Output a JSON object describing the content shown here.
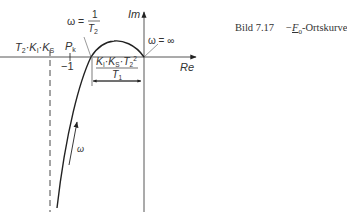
{
  "caption": {
    "figure_label": "Bild 7.17",
    "minus": "−",
    "symbol": "F",
    "symbol_sub": "0",
    "title_suffix": "-Ortskurve"
  },
  "axes": {
    "imag_label": "Im",
    "real_label": "Re"
  },
  "labels": {
    "asymptote": "T₂·Kᵢ·K_S",
    "asymptote_main": [
      "T",
      "·K",
      "·K"
    ],
    "asymptote_subs": [
      "2",
      "I",
      "S"
    ],
    "critical_point": "P",
    "critical_point_sub": "k",
    "minus_one": "−1",
    "omega_crossing_prefix": "ω =",
    "omega_crossing_num": "1",
    "omega_crossing_den": "T",
    "omega_crossing_den_sub": "2",
    "omega_infinity": "ω = ∞",
    "dimension_numerator": "Kᵢ·K_S·T₂²",
    "dimension_denominator": "T",
    "dimension_denominator_sub": "1",
    "direction_arrow": "ω"
  },
  "colors": {
    "line": "#222222",
    "axis": "#444444",
    "text": "#333333"
  }
}
